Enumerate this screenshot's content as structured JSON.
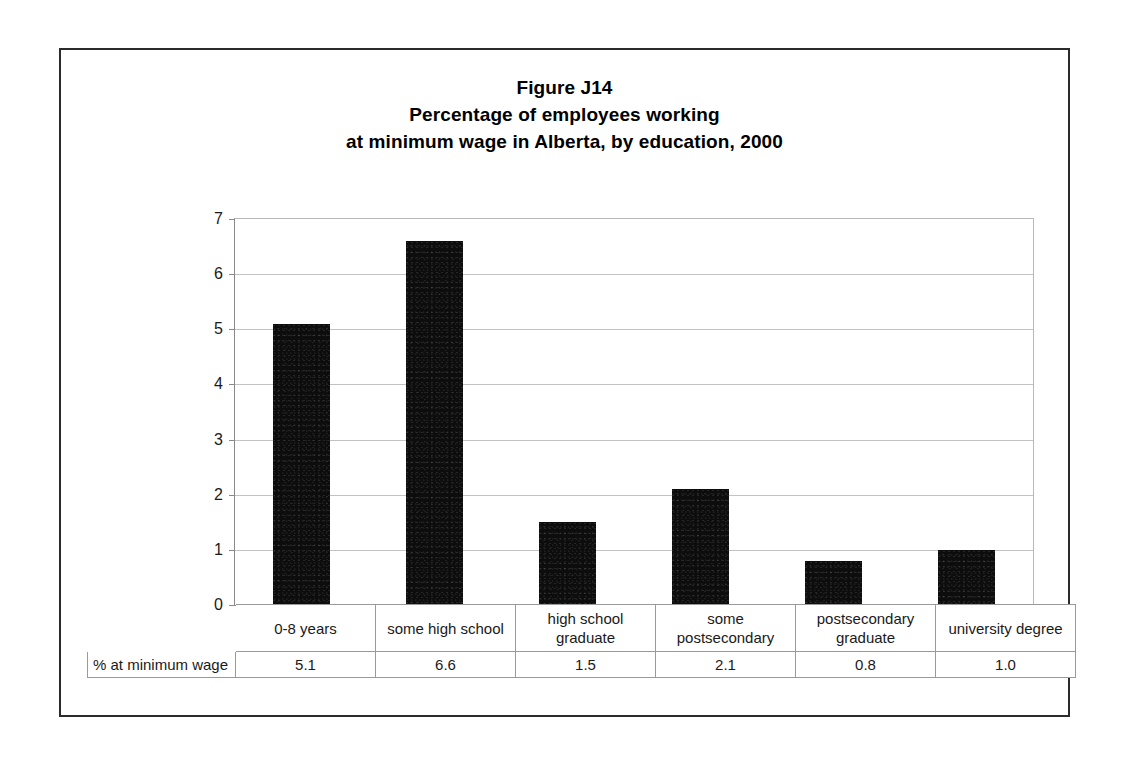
{
  "title": {
    "line1": "Figure J14",
    "line2": "Percentage of employees working",
    "line3": "at minimum wage in Alberta, by education, 2000"
  },
  "table": {
    "row_header": "% at minimum wage"
  },
  "chart_data": {
    "type": "bar",
    "title": "Figure J14 Percentage of employees working at minimum wage in Alberta, by education, 2000",
    "xlabel": "",
    "ylabel": "",
    "ylim": [
      0,
      7
    ],
    "yticks": [
      "0",
      "1",
      "2",
      "3",
      "4",
      "5",
      "6",
      "7"
    ],
    "grid": true,
    "legend": false,
    "categories": [
      "0-8 years",
      "some high school",
      "high school graduate",
      "some postsecondary",
      "postsecondary graduate",
      "university degree"
    ],
    "category_lines": [
      [
        "0-8 years"
      ],
      [
        "some high school"
      ],
      [
        "high school",
        "graduate"
      ],
      [
        "some",
        "postsecondary"
      ],
      [
        "postsecondary",
        "graduate"
      ],
      [
        "university degree"
      ]
    ],
    "values": [
      5.1,
      6.6,
      1.5,
      2.1,
      0.8,
      1.0
    ],
    "value_labels": [
      "5.1",
      "6.6",
      "1.5",
      "2.1",
      "0.8",
      "1.0"
    ],
    "series_name": "% at minimum wage",
    "bar_color": "#0d0d0d"
  }
}
